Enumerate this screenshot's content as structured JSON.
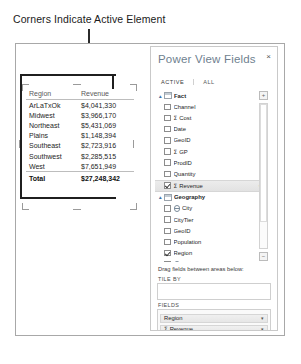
{
  "annotation": {
    "label": "Corners Indicate Active Element"
  },
  "table_visual": {
    "name": "region-revenue-table",
    "columns": [
      "Region",
      "Revenue"
    ],
    "rows": [
      {
        "region": "ArLaTxOk",
        "revenue": "$4,041,330"
      },
      {
        "region": "Midwest",
        "revenue": "$3,966,170"
      },
      {
        "region": "Northeast",
        "revenue": "$5,431,069"
      },
      {
        "region": "Plains",
        "revenue": "$1,148,394"
      },
      {
        "region": "Southeast",
        "revenue": "$2,723,916"
      },
      {
        "region": "Southwest",
        "revenue": "$2,285,515"
      },
      {
        "region": "West",
        "revenue": "$7,651,949"
      }
    ],
    "total": {
      "label": "Total",
      "value": "$27,248,342"
    }
  },
  "panel": {
    "title": "Power View Fields",
    "close_label": "×",
    "tabs": [
      {
        "label": "ACTIVE",
        "active": true
      },
      {
        "label": "ALL",
        "active": false
      }
    ],
    "expand_button": "+",
    "collapse_button": "−",
    "tree": [
      {
        "type": "table",
        "label": "Fact",
        "expander": "▴"
      },
      {
        "type": "field",
        "label": "Channel",
        "checked": false,
        "agg": false,
        "geo": false
      },
      {
        "type": "field",
        "label": "Cost",
        "checked": false,
        "agg": true,
        "geo": false
      },
      {
        "type": "field",
        "label": "Date",
        "checked": false,
        "agg": false,
        "geo": false
      },
      {
        "type": "field",
        "label": "GeoID",
        "checked": false,
        "agg": false,
        "geo": false
      },
      {
        "type": "field",
        "label": "GP",
        "checked": false,
        "agg": true,
        "geo": false
      },
      {
        "type": "field",
        "label": "ProdID",
        "checked": false,
        "agg": false,
        "geo": false
      },
      {
        "type": "field",
        "label": "Quantity",
        "checked": false,
        "agg": false,
        "geo": false
      },
      {
        "type": "field",
        "label": "Revenue",
        "checked": true,
        "agg": true,
        "geo": false,
        "selected": true,
        "caret": "▾"
      },
      {
        "type": "table",
        "label": "Geography",
        "expander": "▴"
      },
      {
        "type": "field",
        "label": "City",
        "checked": false,
        "agg": false,
        "geo": true
      },
      {
        "type": "field",
        "label": "CityTier",
        "checked": false,
        "agg": false,
        "geo": false
      },
      {
        "type": "field",
        "label": "GeoID",
        "checked": false,
        "agg": false,
        "geo": false
      },
      {
        "type": "field",
        "label": "Population",
        "checked": false,
        "agg": false,
        "geo": false
      },
      {
        "type": "field",
        "label": "Region",
        "checked": true,
        "agg": false,
        "geo": false
      },
      {
        "type": "field",
        "label": "State",
        "checked": false,
        "agg": false,
        "geo": true
      },
      {
        "type": "field",
        "label": "StateAbbr",
        "checked": false,
        "agg": false,
        "geo": true
      },
      {
        "type": "table",
        "label": "Products",
        "expander": "▸"
      }
    ],
    "drag_hint": "Drag fields between areas below:",
    "areas": [
      {
        "label": "TILE BY",
        "name": "tile-by-area",
        "pills": []
      },
      {
        "label": "FIELDS",
        "name": "fields-area",
        "pills": [
          {
            "label": "Region",
            "agg": false,
            "caret": "▾"
          },
          {
            "label": "Revenue",
            "agg": true,
            "caret": "▾"
          }
        ]
      }
    ]
  }
}
